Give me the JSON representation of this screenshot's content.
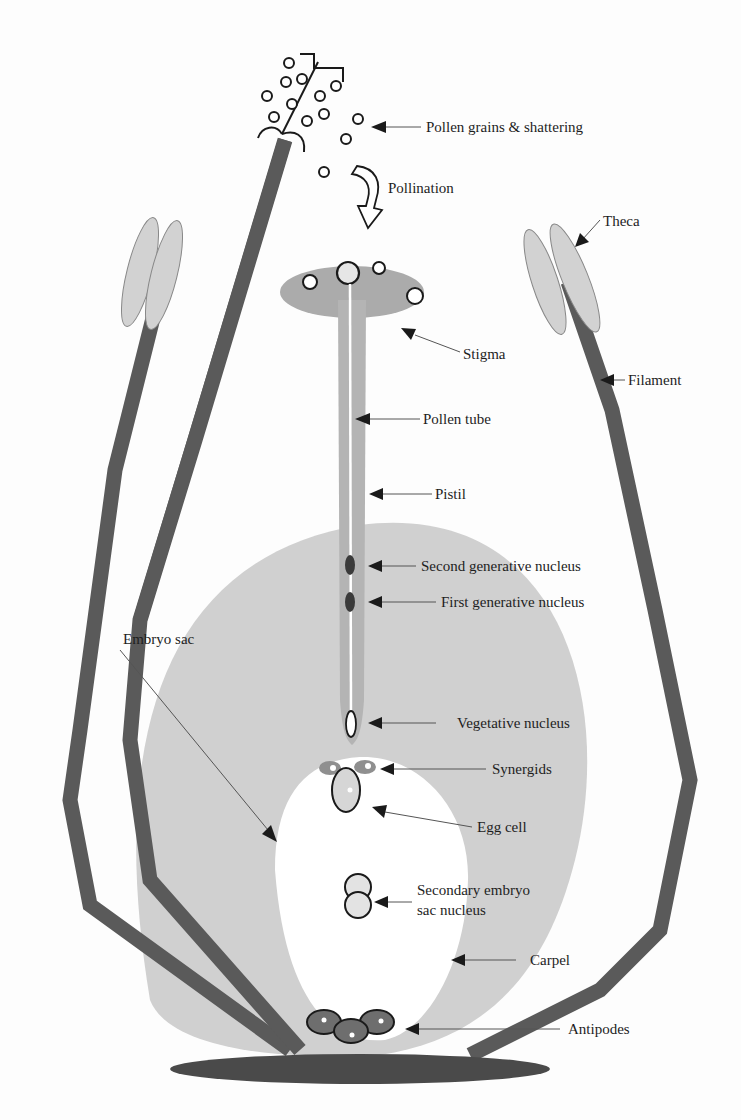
{
  "figure": {
    "colors": {
      "filament": "#5a5a5a",
      "carpel": "#d0d0d0",
      "stigma": "#ababab",
      "receptacle": "#4a4a4a",
      "theca": "#d2d2d2",
      "background": "#fdfdfd"
    }
  },
  "labels": {
    "pollen_grains": "Pollen grains & shattering",
    "pollination": "Pollination",
    "theca": "Theca",
    "stigma": "Stigma",
    "filament": "Filament",
    "pollen_tube": "Pollen tube",
    "pistil": "Pistil",
    "second_generative": "Second generative nucleus",
    "first_generative": "First generative nucleus",
    "embryo_sac": "Embryo sac",
    "vegetative_nucleus": "Vegetative nucleus",
    "synergids": "Synergids",
    "egg_cell": "Egg cell",
    "secondary_line1": "Secondary embryo",
    "secondary_line2": "sac nucleus",
    "carpel": "Carpel",
    "antipodes": "Antipodes"
  },
  "icons": {
    "pollination_arrow": "curved-down-arrow-icon",
    "label_pointer": "triangle-arrowhead-icon"
  }
}
